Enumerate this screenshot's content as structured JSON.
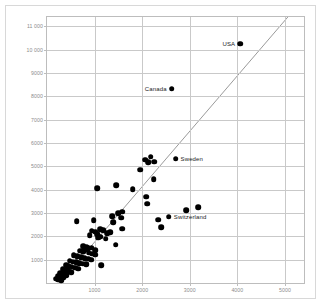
{
  "chart_data": {
    "type": "scatter",
    "title": "",
    "subtitle": "",
    "xlabel": "",
    "ylabel": "",
    "xlim": [
      0,
      5400
    ],
    "ylim": [
      0,
      11400
    ],
    "grid": true,
    "legend": "none",
    "y_ticks": [
      "11 000",
      "10 000",
      "9000",
      "8000",
      "7000",
      "6000",
      "5000",
      "4000",
      "3000",
      "2000",
      "1000"
    ],
    "y_tick_values": [
      11000,
      10000,
      9000,
      8000,
      7000,
      6000,
      5000,
      4000,
      3000,
      2000,
      1000
    ],
    "x_ticks": [
      "1000",
      "2000",
      "3000",
      "4000",
      "5000"
    ],
    "x_tick_values": [
      1000,
      2000,
      3000,
      4000,
      5000
    ],
    "marker_color": "#000000",
    "trend_line_color": "#9a9a9a",
    "grid_color": "#c9c9c9",
    "trend_line": {
      "x_start": 300,
      "y_start": 0,
      "x_end": 5100,
      "y_end": 11400
    },
    "annotations": [
      {
        "label": "USA",
        "x": 4060,
        "y": 10250,
        "position": "left"
      },
      {
        "label": "Canada",
        "x": 2620,
        "y": 8330,
        "position": "left"
      },
      {
        "label": "Sweden",
        "x": 2700,
        "y": 5330,
        "position": "right"
      },
      {
        "label": "Switzerland",
        "x": 2560,
        "y": 2850,
        "position": "right"
      }
    ],
    "points": [
      {
        "x": 4060,
        "y": 10250
      },
      {
        "x": 2620,
        "y": 8330
      },
      {
        "x": 2700,
        "y": 5330
      },
      {
        "x": 2560,
        "y": 2850
      },
      {
        "x": 2180,
        "y": 5420
      },
      {
        "x": 2130,
        "y": 5180
      },
      {
        "x": 2250,
        "y": 5200
      },
      {
        "x": 2060,
        "y": 5280
      },
      {
        "x": 1960,
        "y": 4850
      },
      {
        "x": 2240,
        "y": 4460
      },
      {
        "x": 1450,
        "y": 4180
      },
      {
        "x": 1050,
        "y": 4060
      },
      {
        "x": 1800,
        "y": 4020
      },
      {
        "x": 2080,
        "y": 3700
      },
      {
        "x": 2100,
        "y": 3400
      },
      {
        "x": 3180,
        "y": 3260
      },
      {
        "x": 2920,
        "y": 3120
      },
      {
        "x": 1580,
        "y": 3050
      },
      {
        "x": 1490,
        "y": 2980
      },
      {
        "x": 1370,
        "y": 2860
      },
      {
        "x": 1560,
        "y": 2790
      },
      {
        "x": 2340,
        "y": 2720
      },
      {
        "x": 980,
        "y": 2680
      },
      {
        "x": 620,
        "y": 2640
      },
      {
        "x": 1390,
        "y": 2600
      },
      {
        "x": 2400,
        "y": 2380
      },
      {
        "x": 1580,
        "y": 2320
      },
      {
        "x": 1120,
        "y": 2300
      },
      {
        "x": 1180,
        "y": 2260
      },
      {
        "x": 940,
        "y": 2240
      },
      {
        "x": 1010,
        "y": 2200
      },
      {
        "x": 1330,
        "y": 2170
      },
      {
        "x": 1260,
        "y": 2140
      },
      {
        "x": 1050,
        "y": 2080
      },
      {
        "x": 900,
        "y": 2060
      },
      {
        "x": 1120,
        "y": 1980
      },
      {
        "x": 1070,
        "y": 1940
      },
      {
        "x": 1230,
        "y": 1900
      },
      {
        "x": 1440,
        "y": 1640
      },
      {
        "x": 760,
        "y": 1580
      },
      {
        "x": 830,
        "y": 1540
      },
      {
        "x": 940,
        "y": 1520
      },
      {
        "x": 870,
        "y": 1480
      },
      {
        "x": 800,
        "y": 1440
      },
      {
        "x": 1010,
        "y": 1400
      },
      {
        "x": 700,
        "y": 1380
      },
      {
        "x": 760,
        "y": 1340
      },
      {
        "x": 880,
        "y": 1300
      },
      {
        "x": 940,
        "y": 1260
      },
      {
        "x": 1010,
        "y": 1220
      },
      {
        "x": 560,
        "y": 1180
      },
      {
        "x": 640,
        "y": 1140
      },
      {
        "x": 720,
        "y": 1100
      },
      {
        "x": 790,
        "y": 1060
      },
      {
        "x": 860,
        "y": 1040
      },
      {
        "x": 930,
        "y": 1000
      },
      {
        "x": 480,
        "y": 960
      },
      {
        "x": 540,
        "y": 920
      },
      {
        "x": 610,
        "y": 890
      },
      {
        "x": 680,
        "y": 860
      },
      {
        "x": 750,
        "y": 830
      },
      {
        "x": 820,
        "y": 800
      },
      {
        "x": 400,
        "y": 760
      },
      {
        "x": 460,
        "y": 720
      },
      {
        "x": 520,
        "y": 690
      },
      {
        "x": 590,
        "y": 660
      },
      {
        "x": 660,
        "y": 620
      },
      {
        "x": 330,
        "y": 580
      },
      {
        "x": 390,
        "y": 540
      },
      {
        "x": 450,
        "y": 500
      },
      {
        "x": 510,
        "y": 460
      },
      {
        "x": 280,
        "y": 420
      },
      {
        "x": 340,
        "y": 380
      },
      {
        "x": 400,
        "y": 340
      },
      {
        "x": 230,
        "y": 300
      },
      {
        "x": 290,
        "y": 260
      },
      {
        "x": 350,
        "y": 220
      },
      {
        "x": 180,
        "y": 180
      },
      {
        "x": 240,
        "y": 140
      },
      {
        "x": 300,
        "y": 110
      },
      {
        "x": 1140,
        "y": 760
      }
    ]
  }
}
